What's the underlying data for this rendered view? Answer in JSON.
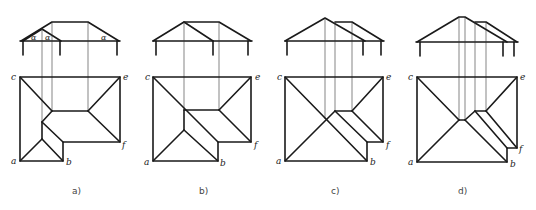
{
  "figure": {
    "panels": [
      {
        "id": "a",
        "caption": "a)",
        "corner_labels": {
          "a": "a",
          "b": "b",
          "c": "c",
          "e": "e",
          "f": "f"
        },
        "angle_label": "α"
      },
      {
        "id": "b",
        "caption": "b)",
        "corner_labels": {
          "a": "a",
          "b": "b",
          "c": "c",
          "e": "e",
          "f": "f"
        }
      },
      {
        "id": "c",
        "caption": "c)",
        "corner_labels": {
          "a": "a",
          "b": "b",
          "c": "c",
          "e": "e",
          "f": "f"
        }
      },
      {
        "id": "d",
        "caption": "d)",
        "corner_labels": {
          "a": "a",
          "b": "b",
          "c": "c",
          "e": "e",
          "f": "f"
        }
      }
    ]
  }
}
